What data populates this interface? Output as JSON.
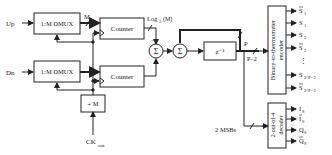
{
  "diagram": {
    "inputs": {
      "up": "Up",
      "dn": "Dn",
      "clock": "CK",
      "clock_sub": "out"
    },
    "blocks": {
      "dmux_top": "1:M DMUX",
      "dmux_bottom": "1:M DMUX",
      "counter_top": "Counter",
      "counter_bottom": "Counter",
      "divider": "÷ M",
      "sum1": "Σ",
      "sum2": "Σ",
      "delay": "z⁻¹",
      "encoder": "Binary-to-thermometer encoder",
      "encoder_line1": "Binary-to-thermometer",
      "encoder_line2": "encoder",
      "decoder_line1": "2-out-of-4",
      "decoder_line2": "decoder"
    },
    "labels": {
      "m_bus": "M",
      "log2m": "Log",
      "log2m_sub": "2",
      "log2m_arg": "(M)",
      "p_bus": "P",
      "p_minus_2": "P−2",
      "two_msbs": "2 MSBs",
      "minus_sign": "−"
    },
    "encoder_outputs": [
      {
        "label": "S",
        "sub": "1",
        "bar": true
      },
      {
        "label": "S",
        "sub": "1",
        "bar": false
      },
      {
        "label": "S",
        "sub": "2",
        "bar": false
      },
      {
        "label": "S",
        "sub": "2",
        "bar": true
      },
      {
        "label": "⋮",
        "sub": "",
        "bar": false
      },
      {
        "label": "S",
        "sub": "2^P−2",
        "bar": false
      },
      {
        "label": "S",
        "sub": "2^P−2",
        "bar": true
      }
    ],
    "decoder_outputs": [
      {
        "label": "I",
        "sub": "S",
        "bar": false
      },
      {
        "label": "I",
        "sub": "S",
        "bar": true
      },
      {
        "label": "Q",
        "sub": "S",
        "bar": false
      },
      {
        "label": "Q",
        "sub": "S",
        "bar": true
      }
    ]
  }
}
